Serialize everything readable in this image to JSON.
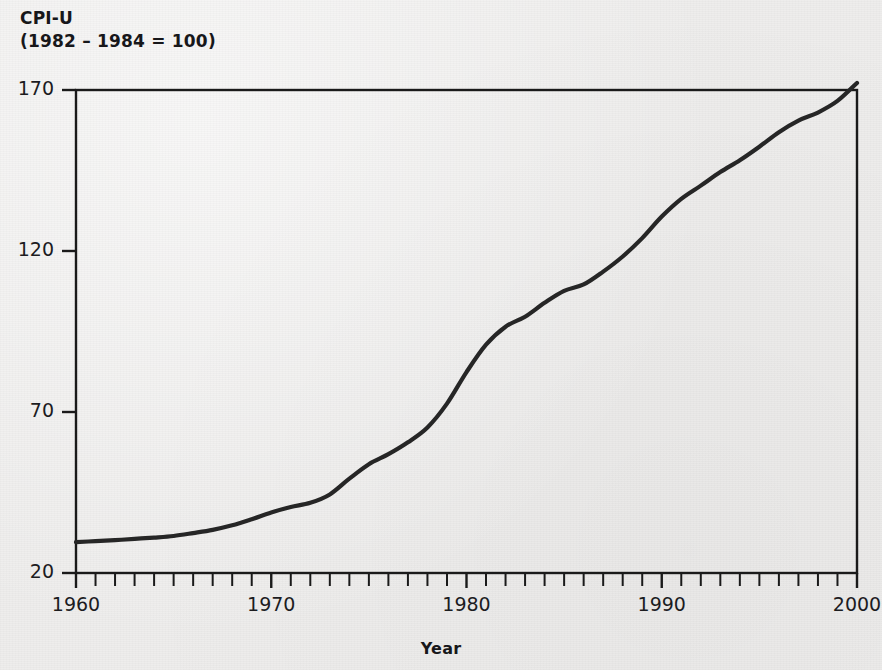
{
  "title": {
    "line1": "CPI-U",
    "line2": "(1982 – 1984 = 100)"
  },
  "axis": {
    "x_label": "Year",
    "y_label": ""
  },
  "colors": {
    "background": "#eeedec",
    "line": "#262626",
    "axis": "#1a1a1a",
    "text": "#17171a"
  },
  "chart_data": {
    "type": "line",
    "title": "CPI-U (1982 – 1984 = 100)",
    "subtitle": "",
    "xlabel": "Year",
    "ylabel": "CPI-U (1982 – 1984 = 100)",
    "xlim": [
      1960,
      2000
    ],
    "ylim": [
      20,
      170
    ],
    "xticks": [
      1960,
      1961,
      1962,
      1963,
      1964,
      1965,
      1966,
      1967,
      1968,
      1969,
      1970,
      1971,
      1972,
      1973,
      1974,
      1975,
      1976,
      1977,
      1978,
      1979,
      1980,
      1981,
      1982,
      1983,
      1984,
      1985,
      1986,
      1987,
      1988,
      1989,
      1990,
      1991,
      1992,
      1993,
      1994,
      1995,
      1996,
      1997,
      1998,
      1999,
      2000
    ],
    "xtick_labels": [
      "1960",
      "1970",
      "1980",
      "1990",
      "2000"
    ],
    "xtick_label_values": [
      1960,
      1970,
      1980,
      1990,
      2000
    ],
    "yticks": [
      20,
      70,
      120,
      170
    ],
    "ytick_labels": [
      "20",
      "70",
      "120",
      "170"
    ],
    "grid": false,
    "legend": null,
    "minor_ticks": "annual",
    "series": [
      {
        "name": "CPI-U",
        "x": [
          1960,
          1961,
          1962,
          1963,
          1964,
          1965,
          1966,
          1967,
          1968,
          1969,
          1970,
          1971,
          1972,
          1973,
          1974,
          1975,
          1976,
          1977,
          1978,
          1979,
          1980,
          1981,
          1982,
          1983,
          1984,
          1985,
          1986,
          1987,
          1988,
          1989,
          1990,
          1991,
          1992,
          1993,
          1994,
          1995,
          1996,
          1997,
          1998,
          1999,
          2000
        ],
        "values": [
          29.6,
          29.9,
          30.2,
          30.6,
          31.0,
          31.5,
          32.4,
          33.4,
          34.8,
          36.7,
          38.8,
          40.5,
          41.8,
          44.4,
          49.3,
          53.8,
          56.9,
          60.6,
          65.2,
          72.6,
          82.4,
          90.9,
          96.5,
          99.6,
          103.9,
          107.6,
          109.6,
          113.6,
          118.3,
          124.0,
          130.7,
          136.2,
          140.3,
          144.5,
          148.2,
          152.4,
          156.9,
          160.5,
          163.0,
          166.6,
          172.2
        ]
      }
    ]
  }
}
